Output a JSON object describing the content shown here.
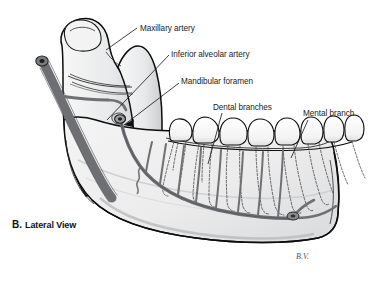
{
  "figure": {
    "domain_kind": "anatomical-illustration",
    "caption_letter": "B.",
    "caption_text": "Lateral View",
    "signature": "B.V.",
    "background_color": "#ffffff",
    "bone_fill_color": "#ececed",
    "bone_shadow_color": "#cfd0d1",
    "artery_color": "#6f7073",
    "outline_color": "#0d0d0d",
    "label_color": "#1b1b1b"
  },
  "labels": [
    {
      "id": "maxillary-artery",
      "text": "Maxillary artery",
      "x": 140,
      "y": 31,
      "anchor": "start"
    },
    {
      "id": "inferior-alveolar-artery",
      "text": "Inferior alveolar artery",
      "x": 171,
      "y": 57,
      "anchor": "start"
    },
    {
      "id": "mandibular-foramen",
      "text": "Mandibular foramen",
      "x": 181,
      "y": 84,
      "anchor": "start"
    },
    {
      "id": "dental-branches",
      "text": "Dental branches",
      "x": 213,
      "y": 110,
      "anchor": "start"
    },
    {
      "id": "mental-branch",
      "text": "Mental branch",
      "x": 303,
      "y": 116,
      "anchor": "start"
    }
  ],
  "leader_lines": [
    {
      "id": "leader-maxillary-artery",
      "path": "M 137 28 L 106 50"
    },
    {
      "id": "leader-inferior-alveolar-artery",
      "path": "M 169 55 L 107 120"
    },
    {
      "id": "leader-mandibular-foramen",
      "path": "M 179 83 L 124 125"
    },
    {
      "id": "leader-dental-branches",
      "path": "M 222 113 L 208 164"
    },
    {
      "id": "leader-mental-branch",
      "path": "M 308 120 L 291 158"
    }
  ],
  "structures": [
    {
      "id": "mandible-body",
      "name": "mandible-body"
    },
    {
      "id": "mandibular-ramus",
      "name": "mandibular-ramus"
    },
    {
      "id": "mandibular-condyle",
      "name": "mandibular-condyle"
    },
    {
      "id": "coronoid-process",
      "name": "coronoid-process"
    },
    {
      "id": "teeth-row",
      "name": "teeth-row",
      "tooth_count": 8
    },
    {
      "id": "tooth-roots",
      "name": "tooth-roots-dashed"
    },
    {
      "id": "maxillary-artery-vessel",
      "name": "maxillary-artery-vessel"
    },
    {
      "id": "inferior-alveolar-artery-vessel",
      "name": "inferior-alveolar-artery-vessel"
    },
    {
      "id": "mandibular-foramen-opening",
      "name": "mandibular-foramen-opening"
    },
    {
      "id": "mental-foramen-opening",
      "name": "mental-foramen-opening"
    }
  ]
}
